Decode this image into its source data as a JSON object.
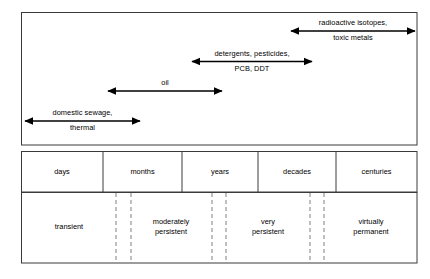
{
  "figure": {
    "type": "timeline-persistence-diagram",
    "frame": {
      "x": 21.5,
      "y": 12.5,
      "width": 395.5,
      "height": 132.5,
      "stroke": "#3a3a3a"
    },
    "pollutant_bars": [
      {
        "name": "radioactive-isotopes",
        "label_line1": "radioactive isotopes,",
        "label_line2": "toxic metals",
        "x_start": 291,
        "x_end": 415,
        "y": 31
      },
      {
        "name": "detergents-pesticides",
        "label_line1": "detergents, pesticides,",
        "label_line2": "PCB, DDT",
        "x_start": 192,
        "x_end": 312,
        "y": 61.5
      },
      {
        "name": "oil",
        "label_line1": "oil",
        "label_line2": "",
        "x_start": 108,
        "x_end": 222,
        "y": 91
      },
      {
        "name": "domestic-sewage",
        "label_line1": "domestic sewage,",
        "label_line2": "thermal",
        "x_start": 25,
        "x_end": 140,
        "y": 121
      }
    ],
    "timescale_row": {
      "y_top": 151,
      "y_bottom": 192,
      "dividers": [
        103,
        182,
        258,
        336
      ],
      "cells": [
        {
          "name": "days",
          "label": "days",
          "center_x": 62
        },
        {
          "name": "months",
          "label": "months",
          "center_x": 142.5
        },
        {
          "name": "years",
          "label": "years",
          "center_x": 220
        },
        {
          "name": "decades",
          "label": "decades",
          "center_x": 297
        },
        {
          "name": "centuries",
          "label": "centuries",
          "center_x": 376.5
        }
      ]
    },
    "persistence_row": {
      "y_top": 192,
      "y_bottom": 263,
      "dashed_dividers": [
        116,
        131,
        212,
        226,
        310,
        324
      ],
      "cells": [
        {
          "name": "transient",
          "label": "transient",
          "center_x": 69
        },
        {
          "name": "moderately-persistent",
          "label": "moderately\npersistent",
          "center_x": 171
        },
        {
          "name": "very-persistent",
          "label": "very\npersistent",
          "center_x": 268
        },
        {
          "name": "virtually-permanent",
          "label": "virtually\npermanent",
          "center_x": 371
        }
      ]
    },
    "colors": {
      "line": "#000000",
      "border": "#3a3a3a",
      "dashed": "#808080",
      "background": "#ffffff"
    }
  }
}
